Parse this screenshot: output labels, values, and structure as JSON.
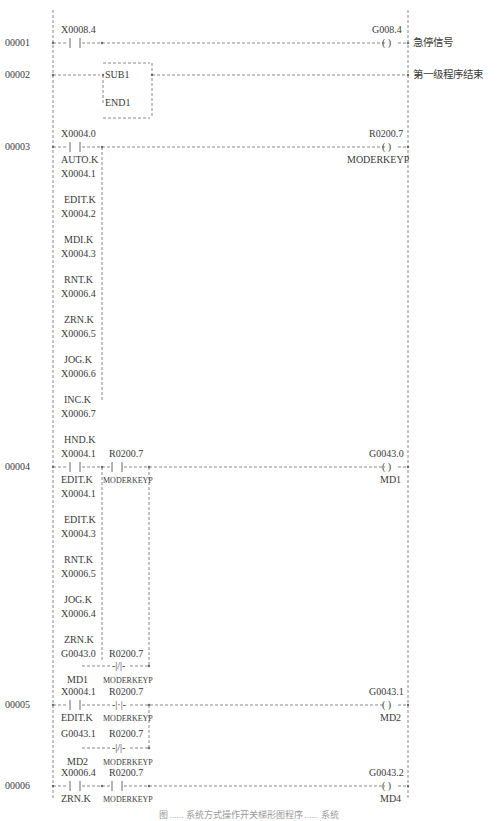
{
  "diagram": {
    "type": "ladder-logic",
    "colors": {
      "line": "#6a6a6a",
      "text": "#3a3a3a"
    },
    "rungs": [
      {
        "number": "00001",
        "contacts": [
          {
            "address": "X0008.4",
            "symbol": "--| |--"
          }
        ],
        "coil": {
          "address": "G008.4",
          "symbol": "( )"
        },
        "comment": "急停信号"
      },
      {
        "number": "00002",
        "function_block": {
          "top": "SUB1",
          "bottom": "END1"
        },
        "comment": "第一级程序结束"
      },
      {
        "number": "00003",
        "parallel_contacts": [
          {
            "address": "X0004.0",
            "label": "AUTO.K"
          },
          {
            "address": "X0004.1",
            "label": "EDIT.K"
          },
          {
            "address": "X0004.2",
            "label": "MDI.K"
          },
          {
            "address": "X0004.3",
            "label": "RNT.K"
          },
          {
            "address": "X0006.4",
            "label": "ZRN.K"
          },
          {
            "address": "X0006.5",
            "label": "JOG.K"
          },
          {
            "address": "X0006.6",
            "label": "INC.K"
          },
          {
            "address": "X0006.7",
            "label": "HND.K"
          }
        ],
        "coil": {
          "address": "R0200.7",
          "label": "MODERKEYP",
          "symbol": "( )"
        }
      },
      {
        "number": "00004",
        "parallel_contacts": [
          {
            "address": "X0004.1",
            "label": "EDIT.K"
          },
          {
            "address": "X0004.1",
            "label": "EDIT.K"
          },
          {
            "address": "X0004.3",
            "label": "RNT.K"
          },
          {
            "address": "X0006.5",
            "label": "JOG.K"
          },
          {
            "address": "X0006.4",
            "label": "ZRN.K"
          }
        ],
        "series_contact": {
          "address": "R0200.7",
          "label": "MODERKEYP",
          "symbol": "--| |--"
        },
        "self_hold": {
          "contact": {
            "address": "G0043.0",
            "label": "MD1"
          },
          "nc_contact": {
            "address": "R0200.7",
            "label": "MODERKEYP",
            "symbol": "-|/|-"
          }
        },
        "coil": {
          "address": "G0043.0",
          "label": "MD1",
          "symbol": "( )"
        }
      },
      {
        "number": "00005",
        "contacts": [
          {
            "address": "X0004.1",
            "label": "EDIT.K"
          },
          {
            "address": "R0200.7",
            "label": "MODERKEYP",
            "symbol": "-|·|-"
          }
        ],
        "self_hold": {
          "contact": {
            "address": "G0043.1",
            "label": "MD2"
          },
          "nc_contact": {
            "address": "R0200.7",
            "label": "MODERKEYP",
            "symbol": "-|/|-"
          }
        },
        "coil": {
          "address": "G0043.1",
          "label": "MD2",
          "symbol": "( )"
        }
      },
      {
        "number": "00006",
        "contacts": [
          {
            "address": "X0006.4",
            "label": "ZRN.K"
          },
          {
            "address": "R0200.7",
            "label": "MODERKEYP"
          }
        ],
        "coil": {
          "address": "G0043.2",
          "label": "MD4",
          "symbol": "( )"
        }
      }
    ],
    "caption": "图 ...... 系统方式操作开关梯形图程序 ...... 系统"
  }
}
